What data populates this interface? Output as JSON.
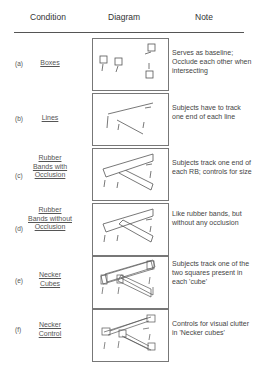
{
  "header": {
    "condition": "Condition",
    "diagram": "Diagram",
    "note": "Note"
  },
  "rows": [
    {
      "label": "(a)",
      "condition": "Boxes",
      "note": "Serves as baseline; Occlude each other when intersecting",
      "diagram_icon": "boxes-diagram-icon"
    },
    {
      "label": "(b)",
      "condition": "Lines",
      "note": "Subjects have to track one end of each line",
      "diagram_icon": "lines-diagram-icon"
    },
    {
      "label": "(c)",
      "condition": "Rubber Bands with Occlusion",
      "note": "Subjects track one end of each RB; controls for size",
      "diagram_icon": "rubber-bands-occlusion-diagram-icon"
    },
    {
      "label": "(d)",
      "condition": "Rubber Bands without Occlusion",
      "note": "Like rubber bands, but without any occlusion",
      "diagram_icon": "rubber-bands-no-occlusion-diagram-icon"
    },
    {
      "label": "(e)",
      "condition": "Necker Cubes",
      "note": "Subjects track one of the two squares present in each 'cube'",
      "diagram_icon": "necker-cubes-diagram-icon"
    },
    {
      "label": "(f)",
      "condition": "Necker Control",
      "note": "Controls for visual clutter in 'Necker cubes'",
      "diagram_icon": "necker-control-diagram-icon"
    }
  ]
}
